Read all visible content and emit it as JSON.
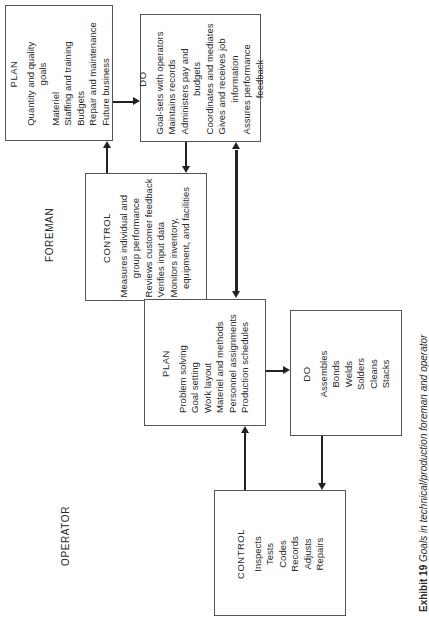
{
  "diagram": {
    "orientation": "rotated 90 degrees counter-clockwise",
    "roles": {
      "foreman": "FOREMAN",
      "operator": "OPERATOR"
    },
    "foreman": {
      "plan": {
        "title": "PLAN",
        "items": [
          "Quantity and quality",
          "goals",
          "Materiel",
          "Staffing and training",
          "Budgets",
          "Repair and maintenance",
          "Future business"
        ]
      },
      "do": {
        "title": "DO",
        "items": [
          "Goal-sets with operators",
          "Maintains records",
          "Administers pay and",
          "budgets",
          "Coordinates and mediates",
          "Gives and receives job",
          "information",
          "Assures performance",
          "feedback"
        ]
      },
      "control": {
        "title": "CONTROL",
        "items": [
          "Measures individual and",
          "group performance",
          "Reviews customer feedback",
          "Verifies input data",
          "Monitors inventory,",
          "equipment, and facilities"
        ]
      }
    },
    "operator": {
      "plan": {
        "title": "PLAN",
        "items": [
          "Problem solving",
          "Goal setting",
          "Work layout",
          "Materiel and methods",
          "Personnel assignments",
          "Production schedules"
        ]
      },
      "do": {
        "title": "DO",
        "items": [
          "Assembles",
          "Bonds",
          "Welds",
          "Solders",
          "Cleans",
          "Stacks"
        ]
      },
      "control": {
        "title": "CONTROL",
        "items": [
          "Inspects",
          "Tests",
          "Codes",
          "Records",
          "Adjusts",
          "Repairs"
        ]
      }
    },
    "caption": {
      "label": "Exhibit 19",
      "text": "Goals in technical/production foreman and operator"
    }
  }
}
